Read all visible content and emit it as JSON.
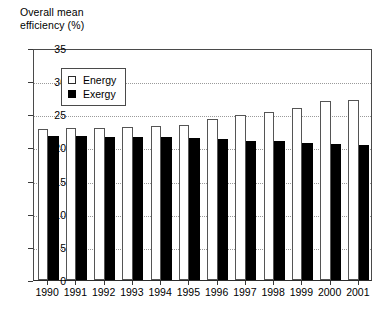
{
  "axis_title": "Overall mean\nefficiency (%)",
  "legend": {
    "position": "inside-top-left",
    "entries": [
      {
        "label": "Energy",
        "swatch": "hollow-square",
        "color": "#ffffff"
      },
      {
        "label": "Exergy",
        "swatch": "filled-square",
        "color": "#000000"
      }
    ]
  },
  "chart_data": {
    "type": "bar",
    "title": "Overall mean efficiency (%)",
    "xlabel": "",
    "ylabel": "Overall mean efficiency (%)",
    "ylim": [
      0,
      35
    ],
    "ytick_step": 5,
    "yticks": [
      0,
      5,
      10,
      15,
      20,
      25,
      30,
      35
    ],
    "ytick_labels": [
      "0",
      "5",
      "10",
      "15",
      "20",
      "25",
      "30",
      "35"
    ],
    "grid": true,
    "grid_axis": "y",
    "grid_style": "dotted",
    "legend_position": "upper left (inside plot)",
    "categories": [
      "1990",
      "1991",
      "1992",
      "1993",
      "1994",
      "1995",
      "1996",
      "1997",
      "1998",
      "1999",
      "2000",
      "2001"
    ],
    "series": [
      {
        "name": "Energy",
        "color": "#ffffff",
        "edge_color": "#555555",
        "values": [
          22.8,
          22.9,
          23.0,
          23.1,
          23.2,
          23.4,
          24.3,
          24.9,
          25.3,
          26.0,
          27.0,
          27.2
        ]
      },
      {
        "name": "Exergy",
        "color": "#000000",
        "edge_color": "#000000",
        "values": [
          21.8,
          21.8,
          21.6,
          21.6,
          21.6,
          21.5,
          21.3,
          21.0,
          20.9,
          20.7,
          20.5,
          20.3
        ]
      }
    ]
  }
}
